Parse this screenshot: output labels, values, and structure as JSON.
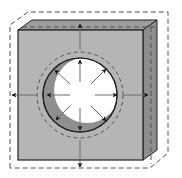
{
  "diagram": {
    "title": "",
    "colors": {
      "background": "#ffffff",
      "front_face": "#b5b5b5",
      "top_face": "#9c9c9c",
      "side_face": "#8e8e8e",
      "crescent": "#8f8f8f",
      "hole": "#ffffff",
      "outline": "#222222",
      "dashed": "#555555",
      "arrow": "#111111",
      "arrow_shaft": "#6a6a6a"
    },
    "block": {
      "front": {
        "x": 18,
        "y": 30,
        "w": 125,
        "h": 130
      },
      "depth": {
        "dx": 14,
        "dy": -10
      }
    },
    "expanded_outline": {
      "front": {
        "x": 10,
        "y": 25,
        "w": 140,
        "h": 143
      },
      "depth": {
        "dx": 18,
        "dy": -13
      }
    },
    "hole": {
      "cx": 80,
      "cy": 95,
      "r_solid": 37,
      "r_dashed": 43,
      "inner_cx": 87,
      "inner_cy": 90,
      "inner_r": 33
    },
    "arrows": {
      "outer": [
        {
          "dir": "up",
          "x1": 80,
          "y1": 50,
          "x2": 80,
          "y2": 24
        },
        {
          "dir": "down",
          "x1": 80,
          "y1": 140,
          "x2": 80,
          "y2": 167
        },
        {
          "dir": "left",
          "x1": 38,
          "y1": 95,
          "x2": 12,
          "y2": 95
        },
        {
          "dir": "right",
          "x1": 124,
          "y1": 95,
          "x2": 148,
          "y2": 95
        }
      ],
      "inner": [
        {
          "dir": "up",
          "x1": 80,
          "y1": 82,
          "x2": 80,
          "y2": 60
        },
        {
          "dir": "down",
          "x1": 80,
          "y1": 108,
          "x2": 80,
          "y2": 130
        },
        {
          "dir": "left",
          "x1": 70,
          "y1": 95,
          "x2": 47,
          "y2": 95
        },
        {
          "dir": "right",
          "x1": 95,
          "y1": 95,
          "x2": 117,
          "y2": 95
        },
        {
          "dir": "up-left",
          "x1": 70,
          "y1": 84,
          "x2": 55,
          "y2": 70
        },
        {
          "dir": "up-right",
          "x1": 91,
          "y1": 84,
          "x2": 106,
          "y2": 69
        },
        {
          "dir": "down-left",
          "x1": 70,
          "y1": 106,
          "x2": 56,
          "y2": 120
        },
        {
          "dir": "down-right",
          "x1": 91,
          "y1": 106,
          "x2": 106,
          "y2": 121
        }
      ]
    }
  }
}
